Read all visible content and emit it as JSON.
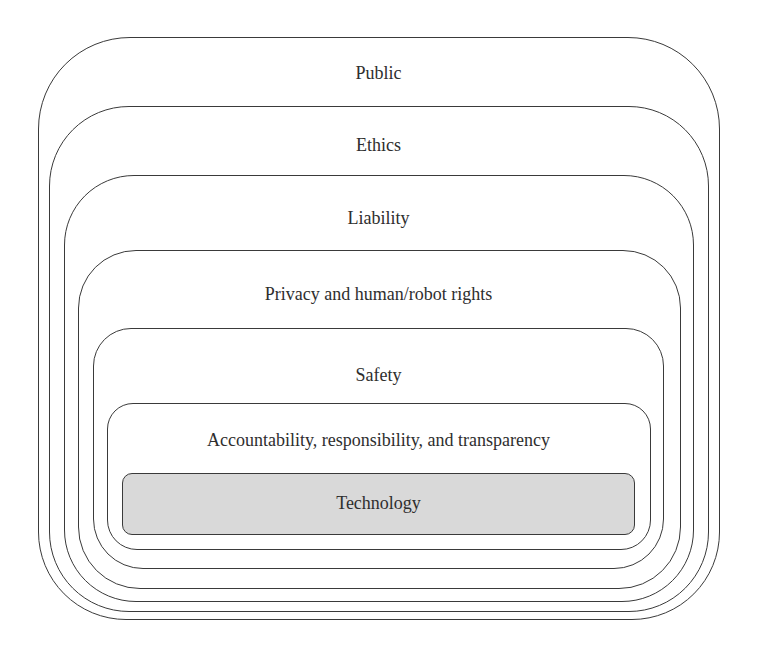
{
  "diagram": {
    "type": "nested-layers",
    "layers": [
      {
        "label": "Public"
      },
      {
        "label": "Ethics"
      },
      {
        "label": "Liability"
      },
      {
        "label": "Privacy and human/robot rights"
      },
      {
        "label": "Safety"
      },
      {
        "label": "Accountability, responsibility, and transparency"
      },
      {
        "label": "Technology"
      }
    ],
    "colors": {
      "stroke": "#3a3a3a",
      "text": "#2e2e2e",
      "core_fill": "#d9d9d9",
      "background": "#ffffff"
    }
  }
}
